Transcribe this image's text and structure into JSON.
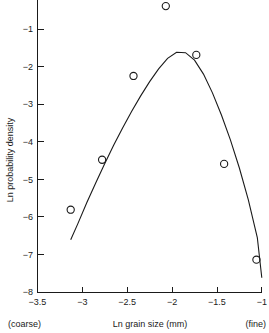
{
  "chart_data": {
    "type": "scatter",
    "title": "",
    "xlabel": "Ln grain size (mm)",
    "ylabel": "Ln probability density",
    "xlim": [
      -3.5,
      -1.0
    ],
    "ylim": [
      -8.0,
      -0.23
    ],
    "xticks": [
      -3.5,
      -3,
      -2.5,
      -2,
      -1.5,
      -1
    ],
    "xtick_labels": [
      "−3.5",
      "−3",
      "−2.5",
      "−2",
      "−1.5",
      "−1"
    ],
    "yticks": [
      -1,
      -2,
      -3,
      -4,
      -5,
      -6,
      -7,
      -8
    ],
    "ytick_labels": [
      "−1",
      "−2",
      "−3",
      "−4",
      "−5",
      "−6",
      "−7",
      "−8"
    ],
    "grid": false,
    "legend": null,
    "x_axis_left_annotation": "(coarse)",
    "x_axis_right_annotation": "(fine)",
    "marker": "open-circle",
    "points": [
      {
        "x": -3.13,
        "y": -5.81
      },
      {
        "x": -2.78,
        "y": -4.48
      },
      {
        "x": -2.43,
        "y": -2.25
      },
      {
        "x": -2.07,
        "y": -0.39
      },
      {
        "x": -1.73,
        "y": -1.69
      },
      {
        "x": -1.42,
        "y": -4.59
      },
      {
        "x": -1.06,
        "y": -7.14
      }
    ],
    "series": [
      {
        "name": "Fitted lognormal curve",
        "type": "line",
        "x": [
          -3.13,
          -3.05,
          -2.95,
          -2.85,
          -2.75,
          -2.65,
          -2.55,
          -2.45,
          -2.35,
          -2.25,
          -2.15,
          -2.05,
          -1.95,
          -1.85,
          -1.75,
          -1.65,
          -1.55,
          -1.45,
          -1.35,
          -1.25,
          -1.15,
          -1.05,
          -1.0
        ],
        "y": [
          -6.61,
          -6.18,
          -5.62,
          -5.09,
          -4.58,
          -4.09,
          -3.63,
          -3.19,
          -2.78,
          -2.4,
          -2.06,
          -1.78,
          -1.62,
          -1.63,
          -1.83,
          -2.2,
          -2.7,
          -3.29,
          -3.95,
          -4.7,
          -5.55,
          -6.55,
          -7.62
        ]
      }
    ],
    "colors": {
      "axis": "#1a1a1a",
      "marker": "#1a1a1a",
      "curve": "#1a1a1a",
      "background": "#ffffff"
    }
  }
}
